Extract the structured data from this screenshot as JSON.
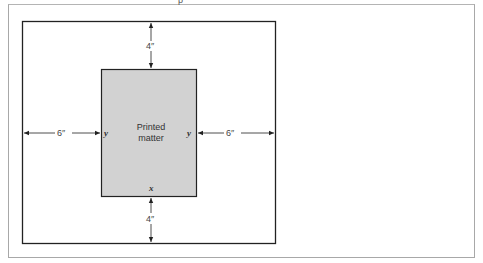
{
  "diagram": {
    "top_fragment": "p",
    "page": {
      "content_label_line1": "Printed",
      "content_label_line2": "matter"
    },
    "dimensions": {
      "top_margin": "4″",
      "bottom_margin": "4″",
      "left_margin": "6″",
      "right_margin": "6″"
    },
    "edge_labels": {
      "left": "y",
      "right": "y",
      "bottom": "x"
    },
    "colors": {
      "printed_area_fill": "#d2d2d2",
      "frame_stroke": "#222222",
      "outer_border": "#a8a8a8"
    }
  }
}
